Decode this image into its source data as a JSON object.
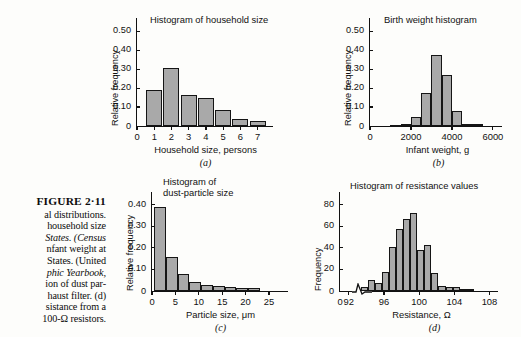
{
  "figure": {
    "label": "FIGURE 2·11",
    "caption_lines": [
      "al distributions.",
      "household size",
      "States. (Census",
      "nfant weight at",
      "States. (United",
      "phic Yearbook,",
      "ion of dust par-",
      "haust filter. (d)",
      "sistance from a",
      "100-Ω resistors."
    ]
  },
  "chart_data": [
    {
      "id": "a",
      "type": "bar",
      "title": "Histogram of household size",
      "panel_letter": "(a)",
      "xlabel": "Household size, persons",
      "ylabel": "Relative frequency",
      "categories": [
        "1",
        "2",
        "3",
        "4",
        "5",
        "6",
        "7"
      ],
      "values": [
        0.193,
        0.308,
        0.165,
        0.147,
        0.084,
        0.038,
        0.026
      ],
      "yticks": [
        "0.10",
        "0.20",
        "0.30",
        "0.40",
        "0.50"
      ],
      "ytick_values": [
        0.1,
        0.2,
        0.3,
        0.4,
        0.5
      ],
      "ylim": [
        0,
        0.55
      ],
      "xticks": [
        "0",
        "1",
        "2",
        "3",
        "4",
        "5",
        "6",
        "7"
      ],
      "xtick_values": [
        0,
        1,
        2,
        3,
        4,
        5,
        6,
        7
      ],
      "xlim": [
        0,
        7.6
      ],
      "grid": false,
      "bar_color": "#a9a9a9",
      "bar_edge": "#151515"
    },
    {
      "id": "b",
      "type": "bar",
      "title": "Birth weight histogram",
      "panel_letter": "(b)",
      "xlabel": "Infant weight, g",
      "ylabel": "Relative frequency",
      "bin_edges": [
        1000,
        1500,
        2000,
        2500,
        3000,
        3500,
        4000,
        4500,
        5000,
        5500
      ],
      "values": [
        0.006,
        0.012,
        0.045,
        0.177,
        0.377,
        0.27,
        0.077,
        0.012,
        0.01
      ],
      "yticks": [
        "0.10",
        "0.20",
        "0.30",
        "0.40",
        "0.50"
      ],
      "ytick_values": [
        0.1,
        0.2,
        0.3,
        0.4,
        0.5
      ],
      "ylim": [
        0,
        0.55
      ],
      "xticks": [
        "0",
        "2000",
        "4000",
        "6000"
      ],
      "xtick_values": [
        0,
        2000,
        4000,
        6000
      ],
      "xlim": [
        0,
        6200
      ],
      "grid": false,
      "bar_color": "#a9a9a9",
      "bar_edge": "#151515"
    },
    {
      "id": "c",
      "type": "bar",
      "title": "Histogram of\ndust-particle size",
      "title_line1": "Histogram of",
      "title_line2": "dust-particle size",
      "panel_letter": "(c)",
      "xlabel": "Particle size, μm",
      "ylabel": "Relative frequency",
      "bin_edges": [
        0.5,
        3.0,
        5.5,
        8.0,
        10.5,
        13.0,
        15.5,
        18.0,
        20.5,
        23.0
      ],
      "values": [
        0.39,
        0.157,
        0.08,
        0.04,
        0.03,
        0.024,
        0.02,
        0.016,
        0.012
      ],
      "yticks": [
        "0.10",
        "0.20",
        "0.30",
        "0.40"
      ],
      "ytick_values": [
        0.1,
        0.2,
        0.3,
        0.4
      ],
      "ylim": [
        0,
        0.44
      ],
      "xticks": [
        "0",
        "5",
        "10",
        "15",
        "20",
        "25"
      ],
      "xtick_values": [
        0,
        5,
        10,
        15,
        20,
        25
      ],
      "xlim": [
        0,
        28
      ],
      "grid": false,
      "bar_color": "#a9a9a9",
      "bar_edge": "#151515"
    },
    {
      "id": "d",
      "type": "bar",
      "title": "Histogram of resistance values",
      "panel_letter": "(d)",
      "xlabel": "Resistance, Ω",
      "ylabel": "Frequency",
      "bin_edges": [
        93.4,
        94.2,
        95.0,
        95.8,
        96.6,
        97.4,
        98.2,
        99.0,
        99.8,
        100.6,
        101.4,
        102.2,
        103.0,
        103.8,
        104.6,
        105.4,
        106.2,
        107.0
      ],
      "values": [
        4,
        10,
        7,
        18,
        41,
        57,
        67,
        72,
        38,
        43,
        17,
        5,
        4,
        4,
        2,
        2
      ],
      "yticks": [
        "20",
        "40",
        "60",
        "80"
      ],
      "ytick_values": [
        20,
        40,
        60,
        80
      ],
      "ylim": [
        0,
        88
      ],
      "xticks": [
        "0",
        "92",
        "96",
        "100",
        "104",
        "108"
      ],
      "xtick_values": [
        0,
        92,
        96,
        100,
        104,
        108
      ],
      "xlim": [
        91,
        108.4
      ],
      "axis_break": true,
      "grid": false,
      "bar_color": "#a9a9a9",
      "bar_edge": "#151515"
    }
  ]
}
